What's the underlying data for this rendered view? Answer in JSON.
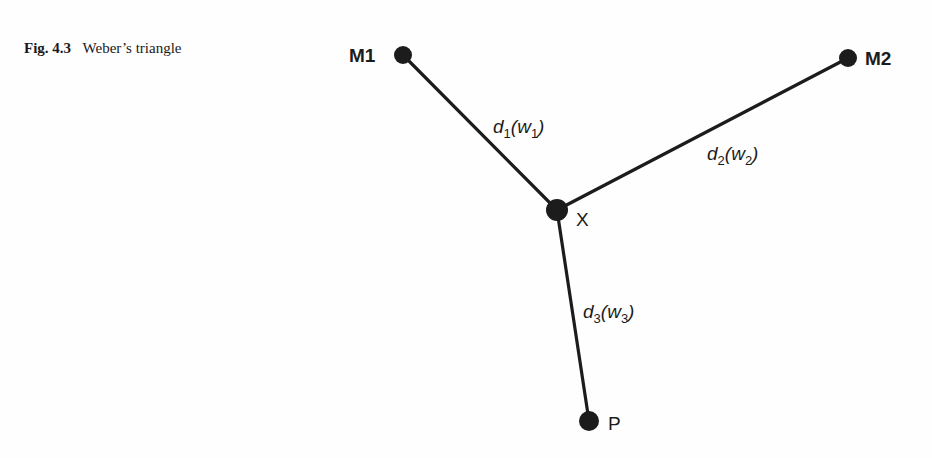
{
  "caption": {
    "figure_number": "Fig. 4.3",
    "title": "Weber’s triangle"
  },
  "diagram": {
    "type": "network",
    "nodes": [
      {
        "id": "M1",
        "label": "M1",
        "x": 403,
        "y": 55
      },
      {
        "id": "M2",
        "label": "M2",
        "x": 848,
        "y": 58
      },
      {
        "id": "X",
        "label": "X",
        "x": 557,
        "y": 210
      },
      {
        "id": "P",
        "label": "P",
        "x": 589,
        "y": 421
      }
    ],
    "edges": [
      {
        "from": "M1",
        "to": "X",
        "label": {
          "d": "d",
          "d_sub": "1",
          "w": "w",
          "w_sub": "1"
        }
      },
      {
        "from": "M2",
        "to": "X",
        "label": {
          "d": "d",
          "d_sub": "2",
          "w": "w",
          "w_sub": "2"
        }
      },
      {
        "from": "X",
        "to": "P",
        "label": {
          "d": "d",
          "d_sub": "3",
          "w": "w",
          "w_sub": "3"
        }
      }
    ],
    "colors": {
      "ink": "#1c1c1c",
      "background": "#fefefe"
    }
  }
}
